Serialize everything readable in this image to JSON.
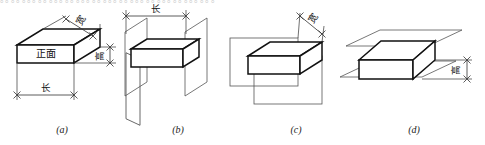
{
  "figure": {
    "caption_style": "italic-parenthesized",
    "background_color": "#ffffff",
    "line_color": "#111111",
    "top_cut_text": "。。。。。。。。。。。。。。。。。。。。。。。。。。。。。。。。。。。。。。。。",
    "panels": [
      {
        "id": "a",
        "caption": "(a)",
        "labels": {
          "front_face": "正面",
          "length": "长",
          "width": "宽",
          "height": "高"
        },
        "dimensions_shown": [
          "长",
          "宽",
          "高"
        ],
        "planes": 0
      },
      {
        "id": "b",
        "caption": "(b)",
        "labels": {
          "length": "长"
        },
        "dimensions_shown": [
          "长"
        ],
        "planes": 2,
        "plane_orientation": "vertical-side"
      },
      {
        "id": "c",
        "caption": "(c)",
        "labels": {
          "width": "宽"
        },
        "dimensions_shown": [
          "宽"
        ],
        "planes": 2,
        "plane_orientation": "vertical-front"
      },
      {
        "id": "d",
        "caption": "(d)",
        "labels": {
          "height": "高"
        },
        "dimensions_shown": [
          "高"
        ],
        "planes": 2,
        "plane_orientation": "horizontal"
      }
    ]
  }
}
